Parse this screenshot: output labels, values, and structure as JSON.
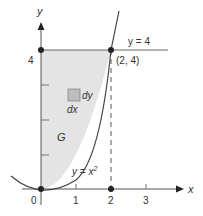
{
  "diagram": {
    "axes": {
      "x_label": "x",
      "y_label": "y",
      "x_ticks": [
        "0",
        "1",
        "2",
        "3"
      ],
      "y_ticks": [
        "4"
      ]
    },
    "labels": {
      "line_label": "y = 4",
      "point_label": "(2, 4)",
      "curve_label": "y = x",
      "curve_exponent": "2",
      "region_label": "G",
      "dy_label": "dy",
      "dx_label": "dx"
    },
    "colors": {
      "region_fill": "#e4e4e4",
      "line": "#555555",
      "element_fill": "#bdbdbd"
    }
  }
}
